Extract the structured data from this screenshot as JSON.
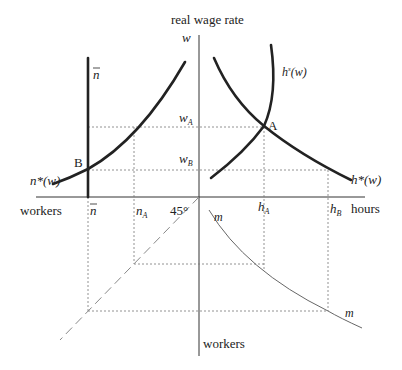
{
  "diagram": {
    "title": "real wage rate",
    "axes": {
      "vertical_top_label": "w",
      "horizontal_left_label": "workers",
      "horizontal_right_label": "hours",
      "vertical_bottom_label": "workers"
    },
    "wage_levels": {
      "w_A": {
        "base": "w",
        "sub": "A"
      },
      "w_B": {
        "base": "w",
        "sub": "B"
      }
    },
    "worker_levels": {
      "n_bar": "n",
      "n_A": {
        "base": "n",
        "sub": "A"
      }
    },
    "hour_levels": {
      "h_A": {
        "base": "h",
        "sub": "A"
      },
      "h_B": {
        "base": "h",
        "sub": "B"
      }
    },
    "angle_label": "45°",
    "curves": {
      "n_star": {
        "label": "n*(w)"
      },
      "n_bar_line": {
        "label": "n"
      },
      "h_s": {
        "base": "h",
        "sup": "s",
        "arg": "(w)"
      },
      "h_star": {
        "label": "h*(w)"
      },
      "m_upper": {
        "label": "m"
      },
      "m_lower": {
        "label": "m"
      }
    },
    "points": {
      "A": "A",
      "B": "B"
    }
  }
}
